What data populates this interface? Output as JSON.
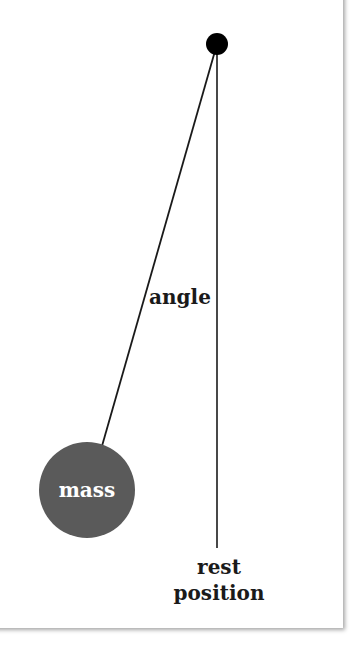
{
  "diagram": {
    "labels": {
      "angle": "angle",
      "mass": "mass",
      "rest_line1": "rest",
      "rest_line2": "position"
    },
    "elements": {
      "pivot": {
        "cx": 217,
        "cy": 44,
        "r": 11,
        "color": "#000000"
      },
      "mass": {
        "cx": 87,
        "cy": 490,
        "r": 48,
        "color": "#5a5a5a"
      },
      "string": {
        "x1": 217,
        "y1": 44,
        "x2": 102,
        "y2": 446
      },
      "rest_line": {
        "x1": 217,
        "y1": 44,
        "x2": 217,
        "y2": 548
      }
    },
    "colors": {
      "line": "#1a1a1a",
      "mass_fill": "#5a5a5a",
      "pivot_fill": "#000000",
      "background": "#ffffff"
    }
  }
}
